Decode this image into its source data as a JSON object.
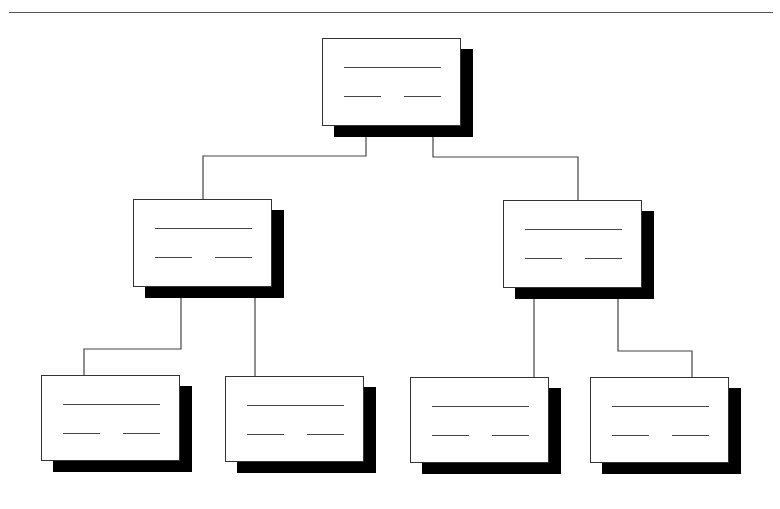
{
  "diagram": {
    "type": "org-chart",
    "levels": 3,
    "colors": {
      "line": "#444444",
      "box_fill": "#ffffff",
      "box_border": "#333333",
      "shadow": "#000000"
    },
    "nodes": [
      {
        "id": "root",
        "x": 322,
        "y": 38,
        "w": 139,
        "h": 88
      },
      {
        "id": "mid-left",
        "x": 133,
        "y": 199,
        "w": 139,
        "h": 88
      },
      {
        "id": "mid-right",
        "x": 503,
        "y": 200,
        "w": 139,
        "h": 88
      },
      {
        "id": "leaf-1",
        "x": 41,
        "y": 375,
        "w": 139,
        "h": 86
      },
      {
        "id": "leaf-2",
        "x": 225,
        "y": 376,
        "w": 139,
        "h": 86
      },
      {
        "id": "leaf-3",
        "x": 410,
        "y": 377,
        "w": 139,
        "h": 86
      },
      {
        "id": "leaf-4",
        "x": 590,
        "y": 377,
        "w": 139,
        "h": 86
      }
    ],
    "edges": [
      {
        "from": "root",
        "to": "mid-left",
        "points": [
          [
            366,
            137
          ],
          [
            366,
            156
          ],
          [
            203,
            156
          ],
          [
            203,
            199
          ]
        ]
      },
      {
        "from": "root",
        "to": "mid-right",
        "points": [
          [
            433,
            137
          ],
          [
            433,
            157
          ],
          [
            578,
            157
          ],
          [
            578,
            200
          ]
        ]
      },
      {
        "from": "mid-left",
        "to": "leaf-1",
        "points": [
          [
            181,
            297
          ],
          [
            181,
            349
          ],
          [
            84,
            349
          ],
          [
            84,
            375
          ]
        ]
      },
      {
        "from": "mid-left",
        "to": "leaf-2",
        "points": [
          [
            255,
            297
          ],
          [
            255,
            376
          ]
        ]
      },
      {
        "from": "mid-right",
        "to": "leaf-3",
        "points": [
          [
            534,
            298
          ],
          [
            534,
            377
          ]
        ]
      },
      {
        "from": "mid-right",
        "to": "leaf-4",
        "points": [
          [
            618,
            298
          ],
          [
            618,
            351
          ],
          [
            692,
            351
          ],
          [
            692,
            377
          ]
        ]
      }
    ]
  }
}
